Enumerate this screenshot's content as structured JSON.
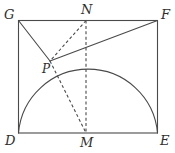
{
  "figure": {
    "background_color": "#ffffff",
    "stroke_color": "#4a4a4a",
    "label_color": "#2e2e2e",
    "canvas": {
      "width": 175,
      "height": 153
    },
    "labels": {
      "G": "G",
      "N": "N",
      "F": "F",
      "P": "P",
      "D": "D",
      "M": "M",
      "E": "E"
    },
    "points": {
      "G": {
        "x": 18,
        "y": 20
      },
      "N": {
        "x": 86,
        "y": 20
      },
      "F": {
        "x": 158,
        "y": 20
      },
      "P": {
        "x": 50,
        "y": 61
      },
      "D": {
        "x": 18,
        "y": 133
      },
      "M": {
        "x": 86,
        "y": 133
      },
      "E": {
        "x": 158,
        "y": 133
      }
    },
    "label_positions": {
      "G": {
        "x": 4,
        "y": 8
      },
      "N": {
        "x": 81,
        "y": 4
      },
      "F": {
        "x": 161,
        "y": 8
      },
      "P": {
        "x": 42,
        "y": 64
      },
      "D": {
        "x": 5,
        "y": 134
      },
      "M": {
        "x": 81,
        "y": 136
      },
      "E": {
        "x": 160,
        "y": 134
      }
    },
    "shapes": {
      "rectangle": {
        "name": "rectangle-DEFG",
        "x": 18,
        "y": 20,
        "width": 140,
        "height": 113,
        "style": "solid"
      },
      "semicircle": {
        "name": "semicircle-on-DE",
        "center": {
          "x": 86,
          "y": 133
        },
        "radius": 70,
        "start": {
          "x": 18,
          "y": 133
        },
        "end": {
          "x": 158,
          "y": 133
        },
        "style": "solid"
      }
    },
    "segments": [
      {
        "name": "segment-G-P",
        "from": "G",
        "to": "P",
        "style": "solid"
      },
      {
        "name": "segment-P-F",
        "from": "P",
        "to": "F",
        "style": "solid"
      },
      {
        "name": "segment-N-P",
        "from": "N",
        "to": "P",
        "style": "dashed"
      },
      {
        "name": "segment-P-M",
        "from": "P",
        "to": "M",
        "style": "dashed"
      },
      {
        "name": "segment-N-M",
        "from": "N",
        "to": "M",
        "style": "dashed"
      }
    ]
  }
}
